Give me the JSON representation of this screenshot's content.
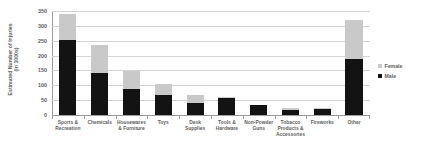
{
  "chart_data": {
    "type": "bar",
    "subtype": "stacked-vertical",
    "title": "",
    "xlabel": "",
    "ylabel": "Estimated Number of Injuries (in 1000s)",
    "ylabel_lines": [
      "Estimated Number of Injuries",
      "(in 1000s)"
    ],
    "ylim": [
      0,
      350
    ],
    "yticks": [
      0,
      50,
      100,
      150,
      200,
      250,
      300,
      350
    ],
    "ytick_labels": [
      "0",
      "50",
      "100",
      "150",
      "200",
      "250",
      "300",
      "350"
    ],
    "grid": true,
    "legend_position": "right",
    "categories": [
      "Sports & Recreation",
      "Chemicals",
      "Housewares & Furniture",
      "Toys",
      "Desk Supplies",
      "Tools & Hardware",
      "Non-Powder Guns",
      "Tobacco Products & Accessories",
      "Fireworks",
      "Other"
    ],
    "category_lines": [
      [
        "Sports &",
        "Recreation"
      ],
      [
        "Chemicals"
      ],
      [
        "Housewares",
        "& Furniture"
      ],
      [
        "Toys"
      ],
      [
        "Desk",
        "Supplies"
      ],
      [
        "Tools &",
        "Hardware"
      ],
      [
        "Non-Powder",
        "Guns"
      ],
      [
        "Tobacco",
        "Products &",
        "Accessories"
      ],
      [
        "Fireworks"
      ],
      [
        "Other"
      ]
    ],
    "series": [
      {
        "name": "Male",
        "color": "#131313",
        "values": [
          251,
          143,
          88,
          69,
          42,
          57,
          33,
          16,
          20,
          187
        ]
      },
      {
        "name": "Female",
        "color": "#c9c9c9",
        "values": [
          89,
          94,
          60,
          36,
          25,
          3,
          2,
          8,
          4,
          133
        ]
      }
    ],
    "totals": [
      340,
      237,
      148,
      105,
      67,
      60,
      35,
      24,
      24,
      320
    ]
  },
  "legend": {
    "items": [
      {
        "label": "Female",
        "color": "#c9c9c9"
      },
      {
        "label": "Male",
        "color": "#131313"
      }
    ]
  },
  "colors": {
    "female": "#c9c9c9",
    "male": "#131313",
    "gridline": "#d4d4d4",
    "axis": "#9a9a9a",
    "text": "#5e5e5e",
    "background": "#ffffff"
  }
}
